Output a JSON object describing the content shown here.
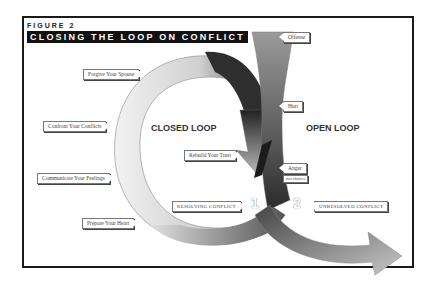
{
  "figure": {
    "label": "FIGURE 2",
    "title": "CLOSING THE LOOP ON CONFLICT"
  },
  "headings": {
    "closed_loop": "CLOSED LOOP",
    "open_loop": "OPEN LOOP"
  },
  "closed_loop_steps": [
    {
      "label": "Forgive Your Spouse"
    },
    {
      "label": "Confront Your Conflicts"
    },
    {
      "label": "Communicate Your Feelings"
    },
    {
      "label": "Prepare Your Heart"
    },
    {
      "label": "Rebuild Your Trust"
    }
  ],
  "open_loop_steps": [
    {
      "label": "Offense"
    },
    {
      "label": "Hurt"
    },
    {
      "label": "Anger"
    },
    {
      "label": "two choices"
    }
  ],
  "paths": [
    {
      "number": "1",
      "label": "RESOLVING CONFLICT"
    },
    {
      "number": "2",
      "label": "UNRESOLVED CONFLICT"
    }
  ],
  "colors": {
    "frame": "#1a1a1a",
    "title_bg": "#111111",
    "arrow_dark": "#2a2a2a",
    "arrow_light": "#d8d8d8",
    "loop_light": "#e8e8e8"
  }
}
